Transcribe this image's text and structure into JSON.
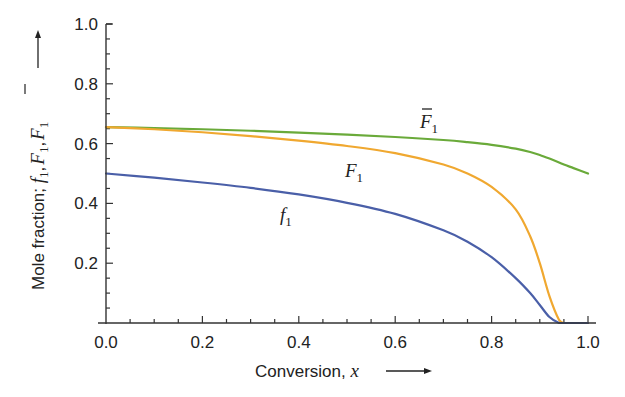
{
  "chart_data": {
    "type": "line",
    "title": "",
    "xlabel": "Conversion, x",
    "ylabel": "Mole fraction; f1, F1, F̄1",
    "xlim": [
      0.0,
      1.0
    ],
    "ylim": [
      0.0,
      1.0
    ],
    "x_ticks": [
      "0.0",
      "0.2",
      "0.4",
      "0.6",
      "0.8",
      "1.0"
    ],
    "y_ticks": [
      "0.2",
      "0.4",
      "0.6",
      "0.8",
      "1.0"
    ],
    "grid": false,
    "legend": "inline labels",
    "x": [
      0.0,
      0.1,
      0.2,
      0.3,
      0.4,
      0.5,
      0.6,
      0.7,
      0.75,
      0.8,
      0.85,
      0.88,
      0.9,
      0.92,
      0.94,
      0.95,
      0.97,
      1.0
    ],
    "series": [
      {
        "name": "F̄1",
        "color": "#6aaa3a",
        "values": [
          0.655,
          0.652,
          0.648,
          0.643,
          0.637,
          0.63,
          0.622,
          0.612,
          0.605,
          0.596,
          0.583,
          0.572,
          0.562,
          0.55,
          0.537,
          0.53,
          0.518,
          0.5
        ]
      },
      {
        "name": "F1",
        "color": "#f0a830",
        "values": [
          0.655,
          0.648,
          0.638,
          0.625,
          0.61,
          0.592,
          0.568,
          0.53,
          0.5,
          0.455,
          0.38,
          0.29,
          0.2,
          0.09,
          0.01,
          0.0,
          0.0,
          0.0
        ]
      },
      {
        "name": "f1",
        "color": "#4a5fa8",
        "values": [
          0.5,
          0.486,
          0.47,
          0.452,
          0.43,
          0.402,
          0.365,
          0.31,
          0.272,
          0.22,
          0.15,
          0.1,
          0.06,
          0.02,
          0.0,
          0.0,
          0.0,
          0.0
        ]
      }
    ],
    "annotations": [
      {
        "text": "F̄1",
        "x": 0.68,
        "y": 0.69
      },
      {
        "text": "F1",
        "x": 0.5,
        "y": 0.515
      },
      {
        "text": "f1",
        "x": 0.365,
        "y": 0.31
      }
    ]
  },
  "axes": {
    "x_title_text": "Conversion, ",
    "x_title_var": "x",
    "y_title_text": "Mole fraction; ",
    "y_title_vars": [
      "f",
      "F",
      "F"
    ],
    "y_title_sub": "1"
  },
  "labels": {
    "fbar_main": "F",
    "fbar_sub": "1",
    "F_main": "F",
    "F_sub": "1",
    "f_main": "f",
    "f_sub": "1"
  }
}
